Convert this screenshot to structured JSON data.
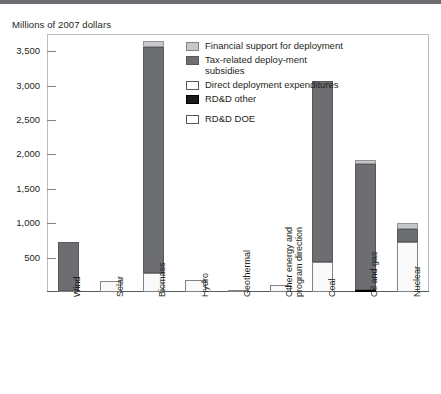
{
  "header": {
    "axis_unit_title": "Millions of 2007 dollars"
  },
  "legend": {
    "items": [
      {
        "key": "financial_support",
        "label": "Financial support for deployment",
        "color": "#c6c7c9"
      },
      {
        "key": "tax_related",
        "label": "Tax-related deploy-ment subsidies",
        "color": "#6d6e71"
      },
      {
        "key": "direct_deployment",
        "label": "Direct deployment expenditures",
        "color": "#ffffff"
      },
      {
        "key": "rdd_other",
        "label": "RD&D other",
        "color": "#1a1a1a"
      },
      {
        "key": "rdd_doe",
        "label": "RD&D DOE",
        "color": "#ffffff"
      }
    ]
  },
  "chart_data": {
    "type": "bar",
    "stacked": true,
    "title": "",
    "subtitle": "",
    "xlabel": "",
    "ylabel": "Millions of 2007 dollars",
    "ylim": [
      0,
      3750
    ],
    "yticks": [
      500,
      1000,
      1500,
      2000,
      2500,
      3000,
      3500
    ],
    "ytick_labels": [
      "500",
      "1,000",
      "1,500",
      "2,000",
      "2,500",
      "3,000",
      "3,500"
    ],
    "grid": false,
    "legend_position": "inside-top-center",
    "categories": [
      "Wind",
      "Solar",
      "Biomass",
      "Hydro",
      "Geothermal",
      "Other energy and program direction",
      "Coal",
      "Oil and gas",
      "Nuclear"
    ],
    "series": [
      {
        "name": "RD&D DOE",
        "color": "#fafafa",
        "values": [
          10,
          160,
          270,
          175,
          20,
          105,
          430,
          0,
          720
        ]
      },
      {
        "name": "RD&D other",
        "color": "#1a1a1a",
        "values": [
          0,
          0,
          0,
          0,
          0,
          0,
          0,
          30,
          0
        ]
      },
      {
        "name": "Direct deployment expenditures",
        "color": "#ffffff",
        "values": [
          0,
          0,
          0,
          0,
          0,
          0,
          0,
          0,
          0
        ]
      },
      {
        "name": "Tax-related deployment subsidies",
        "color": "#6d6e71",
        "values": [
          710,
          0,
          3290,
          0,
          0,
          0,
          2630,
          1830,
          200
        ]
      },
      {
        "name": "Financial support for deployment",
        "color": "#c6c7c9",
        "values": [
          0,
          0,
          90,
          0,
          0,
          0,
          0,
          60,
          90
        ]
      }
    ],
    "totals": [
      720,
      160,
      3650,
      175,
      20,
      105,
      3060,
      1920,
      1010
    ]
  }
}
